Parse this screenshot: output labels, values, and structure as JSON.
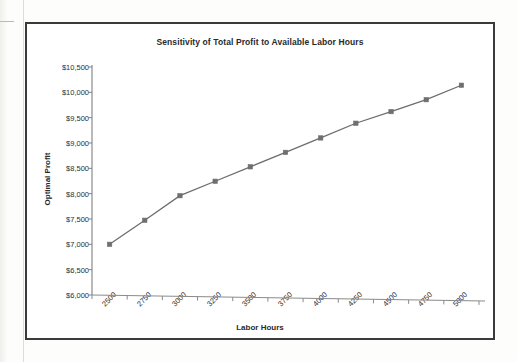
{
  "page": {
    "background_color": "#fdfdfb",
    "frame_border_color": "#3b3b3b"
  },
  "chart_data": {
    "type": "line",
    "title": "Sensitivity of Total Profit to Available Labor Hours",
    "xlabel": "Labor Hours",
    "ylabel": "Optimal Profit",
    "categories": [
      "2500",
      "2750",
      "3000",
      "3250",
      "3500",
      "3750",
      "4000",
      "4250",
      "4500",
      "4750",
      "5000"
    ],
    "values": [
      7000,
      7475,
      7960,
      8245,
      8530,
      8815,
      9100,
      9390,
      9620,
      9855,
      10140
    ],
    "series": [
      {
        "name": "Optimal Profit",
        "values": [
          7000,
          7475,
          7960,
          8245,
          8530,
          8815,
          9100,
          9390,
          9620,
          9855,
          10140
        ]
      }
    ],
    "ylim": [
      6000,
      10500
    ],
    "ytick_values": [
      6000,
      6500,
      7000,
      7500,
      8000,
      8500,
      9000,
      9500,
      10000,
      10500
    ],
    "ytick_labels": [
      "$6,000",
      "$6,500",
      "$7,000",
      "$7,500",
      "$8,000",
      "$8,500",
      "$9,000",
      "$9,500",
      "$10,000",
      "$10,500"
    ],
    "grid": false,
    "legend": "none",
    "line_color": "#6d6d6d",
    "marker_color": "#6f6f6f",
    "marker_shape": "square",
    "xtick_label_rotation": -45
  }
}
